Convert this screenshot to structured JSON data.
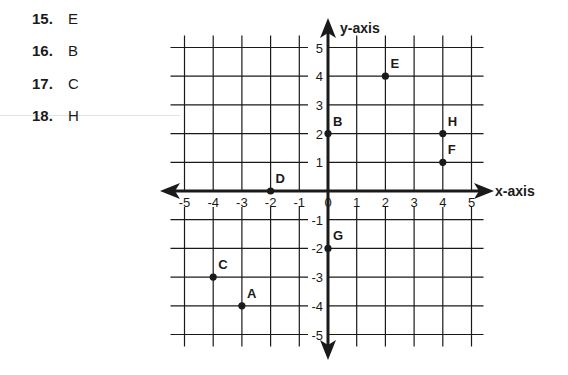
{
  "answers": [
    {
      "num": "15.",
      "value": "E"
    },
    {
      "num": "16.",
      "value": "B"
    },
    {
      "num": "17.",
      "value": "C"
    },
    {
      "num": "18.",
      "value": "H"
    }
  ],
  "chart_data": {
    "type": "scatter",
    "title": "",
    "xlabel": "x-axis",
    "ylabel": "y-axis",
    "xlim": [
      -5,
      5
    ],
    "ylim": [
      -5,
      5
    ],
    "grid": true,
    "x_ticks": [
      "-5",
      "-4",
      "-3",
      "-2",
      "-1",
      "0",
      "1",
      "2",
      "3",
      "4",
      "5"
    ],
    "y_ticks": [
      "5",
      "4",
      "3",
      "2",
      "1",
      "-1",
      "-2",
      "-3",
      "-4",
      "-5"
    ],
    "points": [
      {
        "label": "A",
        "x": -3,
        "y": -4
      },
      {
        "label": "B",
        "x": 0,
        "y": 2
      },
      {
        "label": "C",
        "x": -4,
        "y": -3
      },
      {
        "label": "D",
        "x": -2,
        "y": 0
      },
      {
        "label": "E",
        "x": 2,
        "y": 4
      },
      {
        "label": "F",
        "x": 4,
        "y": 1
      },
      {
        "label": "G",
        "x": 0,
        "y": -2
      },
      {
        "label": "H",
        "x": 4,
        "y": 2
      }
    ]
  }
}
